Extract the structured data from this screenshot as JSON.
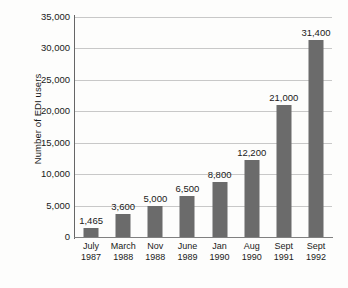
{
  "chart_data": {
    "type": "bar",
    "title": "",
    "xlabel": "",
    "ylabel": "Number of EDI users",
    "ylim": [
      0,
      35000
    ],
    "ytick_labels": [
      "35,000",
      "30,000",
      "25,000",
      "20,000",
      "15,000",
      "10,000",
      "5,000",
      "0"
    ],
    "ytick_values": [
      35000,
      30000,
      25000,
      20000,
      15000,
      10000,
      5000,
      0
    ],
    "grid": true,
    "legend": "none",
    "categories": [
      "July 1987",
      "March 1988",
      "Nov 1988",
      "June 1989",
      "Jan 1990",
      "Aug 1990",
      "Sept 1991",
      "Sept 1992"
    ],
    "category_lines": [
      {
        "month": "July",
        "year": "1987"
      },
      {
        "month": "March",
        "year": "1988"
      },
      {
        "month": "Nov",
        "year": "1988"
      },
      {
        "month": "June",
        "year": "1989"
      },
      {
        "month": "Jan",
        "year": "1990"
      },
      {
        "month": "Aug",
        "year": "1990"
      },
      {
        "month": "Sept",
        "year": "1991"
      },
      {
        "month": "Sept",
        "year": "1992"
      }
    ],
    "values": [
      1465,
      3600,
      5000,
      6500,
      8800,
      12200,
      21000,
      31400
    ],
    "value_labels": [
      "1,465",
      "3,600",
      "5,000",
      "6,500",
      "8,800",
      "12,200",
      "21,000",
      "31,400"
    ],
    "bar_color": "#6b6b6b",
    "grid_color": "#c8c8c8",
    "axis_color": "#666666",
    "background_color": "#fdfdfc"
  }
}
